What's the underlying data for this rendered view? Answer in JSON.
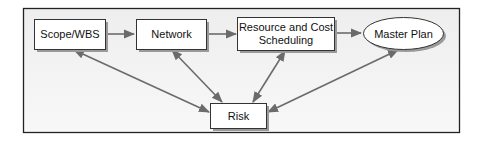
{
  "diagram": {
    "nodes": [
      {
        "id": "scope",
        "label_lines": [
          "Scope/WBS"
        ],
        "shape": "rect"
      },
      {
        "id": "network",
        "label_lines": [
          "Network"
        ],
        "shape": "rect"
      },
      {
        "id": "resource",
        "label_lines": [
          "Resource and Cost",
          "Scheduling"
        ],
        "shape": "rect"
      },
      {
        "id": "master",
        "label_lines": [
          "Master Plan"
        ],
        "shape": "ellipse"
      },
      {
        "id": "risk",
        "label_lines": [
          "Risk"
        ],
        "shape": "rect"
      }
    ],
    "edges": [
      {
        "from": "scope",
        "to": "network",
        "direction": "forward"
      },
      {
        "from": "network",
        "to": "resource",
        "direction": "forward"
      },
      {
        "from": "resource",
        "to": "master",
        "direction": "forward"
      },
      {
        "from": "scope",
        "to": "risk",
        "direction": "both"
      },
      {
        "from": "network",
        "to": "risk",
        "direction": "both"
      },
      {
        "from": "resource",
        "to": "risk",
        "direction": "both"
      },
      {
        "from": "master",
        "to": "risk",
        "direction": "both"
      }
    ],
    "colors": {
      "frame_bg": "#f4f4f4",
      "frame_border": "#222222",
      "node_fill": "#ffffff",
      "node_border": "#333333",
      "shadow": "#9a9a9a",
      "arrow": "#6b6b6b"
    }
  }
}
